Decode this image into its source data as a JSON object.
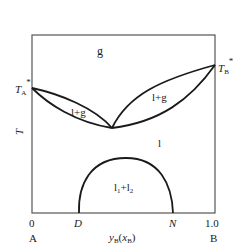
{
  "diagram": {
    "type": "phase-diagram",
    "regions": {
      "gas": "g",
      "liquid_gas_left": "l+g",
      "liquid_gas_right": "l+g",
      "liquid": "l",
      "two_liquids": "l",
      "two_liquids_sub1": "1",
      "two_liquids_plus": "+l",
      "two_liquids_sub2": "2"
    },
    "y_axis": {
      "label": "T",
      "left_point_main": "T",
      "left_point_sub": "A",
      "left_point_sup": "*",
      "right_point_main": "T",
      "right_point_sub": "B",
      "right_point_sup": "*"
    },
    "x_axis": {
      "tick_left": "0",
      "tick_right": "1.0",
      "point_d": "D",
      "point_n": "N",
      "label_y": "y",
      "label_y_sub": "B",
      "label_open": "(",
      "label_x": "x",
      "label_x_sub": "B",
      "label_close": ")",
      "end_left": "A",
      "end_right": "B"
    },
    "colors": {
      "line": "#1a1a1a",
      "frame": "#555555"
    }
  }
}
